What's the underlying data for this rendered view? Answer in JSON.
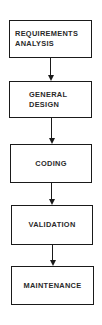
{
  "diagram": {
    "type": "flowchart",
    "direction": "top-to-bottom",
    "nodes": [
      {
        "id": "requirements-analysis",
        "lines": [
          "REQUIREMENTS",
          "ANALYSIS"
        ]
      },
      {
        "id": "general-design",
        "lines": [
          "GENERAL",
          "DESIGN"
        ]
      },
      {
        "id": "coding",
        "lines": [
          "CODING"
        ]
      },
      {
        "id": "validation",
        "lines": [
          "VALIDATION"
        ]
      },
      {
        "id": "maintenance",
        "lines": [
          "MAINTENANCE"
        ]
      }
    ],
    "edges": [
      {
        "from": "requirements-analysis",
        "to": "general-design"
      },
      {
        "from": "general-design",
        "to": "coding"
      },
      {
        "from": "coding",
        "to": "validation"
      },
      {
        "from": "validation",
        "to": "maintenance"
      }
    ]
  }
}
